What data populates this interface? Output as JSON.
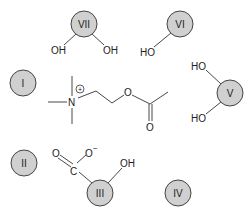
{
  "diagram": {
    "type": "binding-site schematic",
    "colors": {
      "site_fill": "#d0d0d0",
      "site_stroke": "#444444",
      "bond": "#333333"
    },
    "sites": [
      {
        "id": "I",
        "label": "I",
        "cx": 23,
        "cy": 83
      },
      {
        "id": "II",
        "label": "II",
        "cx": 24,
        "cy": 163
      },
      {
        "id": "III",
        "label": "III",
        "cx": 100,
        "cy": 193
      },
      {
        "id": "IV",
        "label": "IV",
        "cx": 178,
        "cy": 193
      },
      {
        "id": "V",
        "label": "V",
        "cx": 230,
        "cy": 93
      },
      {
        "id": "VI",
        "label": "VI",
        "cx": 180,
        "cy": 24
      },
      {
        "id": "VII",
        "label": "VII",
        "cx": 84,
        "cy": 24
      }
    ],
    "groups": {
      "vii_oh_left": "OH",
      "vii_oh_right": "OH",
      "vi_ho": "HO",
      "v_ho_top": "HO",
      "v_ho_bottom": "HO",
      "iii_oh": "OH",
      "carboxylate_o": "O",
      "carboxylate_o_minus": "O",
      "carboxylate_minus_sign": "−",
      "carboxylate_c": "C"
    },
    "ligand": {
      "name": "acetylcholine",
      "n_label": "N",
      "charge": "+",
      "ester_o": "O",
      "carbonyl_o": "O"
    }
  }
}
